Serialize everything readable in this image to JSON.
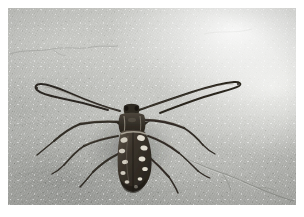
{
  "image": {
    "domain": "natural-image",
    "subject": "longhorn beetle (Cerambycidae) with long curved antennae",
    "scene": "beetle resting on a grey concrete / cement floor",
    "orientation": "landscape",
    "border_style": "white photographic margin",
    "alt_text": "A dark mottled longhorn beetle with very long antennae sits on a rough grey concrete surface",
    "caption": ""
  },
  "colors": {
    "border": "#ffffff",
    "concrete_light": "#d8d9d5",
    "concrete_mid": "#c3c4c0",
    "concrete_dark": "#a6a7a3",
    "concrete_shadow": "#8e908c",
    "beetle_dark": "#332e28",
    "beetle_body": "#4a4238",
    "beetle_pale": "#ddd8cc",
    "beetle_highlight": "#efeade",
    "leg_color": "#3a352d",
    "crack_color": "#8a8c88"
  },
  "subject_parts": [
    {
      "name": "left-antenna",
      "description": "long antenna sweeping up and to the left, hooked at the tip"
    },
    {
      "name": "right-antenna",
      "description": "long antenna sweeping up and to the right"
    },
    {
      "name": "head",
      "description": "small dark head between antennal bases"
    },
    {
      "name": "pronotum",
      "description": "boxy thorax segment behind the head"
    },
    {
      "name": "elytra",
      "description": "mottled wing cases with cream and white blotches"
    },
    {
      "name": "left-legs",
      "description": "three legs extending to the lower left"
    },
    {
      "name": "right-legs",
      "description": "three legs extending to the right and lower right"
    }
  ],
  "background_features": [
    {
      "name": "upper-crack",
      "description": "faint hairline crack across the upper left of the slab"
    },
    {
      "name": "lower-right-crack",
      "description": "branching crack running through the lower right corner"
    },
    {
      "name": "trowel-marks",
      "description": "sweeping float marks in the lower left area"
    },
    {
      "name": "bright-patch",
      "description": "blown-out bright region in the upper right"
    }
  ]
}
